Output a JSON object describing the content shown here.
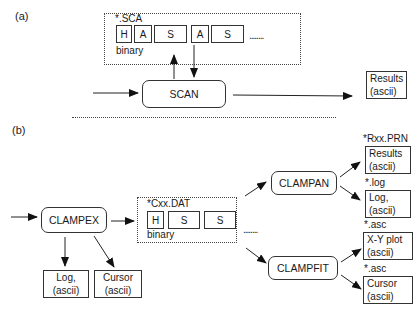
{
  "panel_a": {
    "label": "(a)",
    "file_group": {
      "name": "*.SCA",
      "cells": [
        "H",
        "A",
        "S",
        "A",
        "S"
      ],
      "ellipsis": "........",
      "format": "binary"
    },
    "process": "SCAN",
    "output": {
      "line1": "Results",
      "line2": "(ascii)"
    }
  },
  "panel_b": {
    "label": "(b)",
    "acquire_process": "CLAMPEX",
    "acquire_outputs": [
      {
        "line1": "Log,",
        "line2": "(ascii)"
      },
      {
        "line1": "Cursor",
        "line2": "(ascii)"
      }
    ],
    "file_group": {
      "name": "*Cxx.DAT",
      "cells": [
        "H",
        "S",
        "S"
      ],
      "ellipsis": "........",
      "format": "binary"
    },
    "clampan": {
      "name": "CLAMPAN",
      "outputs": [
        {
          "ext": "*Rxx.PRN",
          "line1": "Results",
          "line2": "(ascii)"
        },
        {
          "ext": "*.log",
          "line1": "Log,",
          "line2": "(ascii)"
        }
      ]
    },
    "clampfit": {
      "name": "CLAMPFIT",
      "outputs": [
        {
          "ext": "*.asc",
          "line1": "X-Y plot",
          "line2": "(ascii)"
        },
        {
          "ext": "*.asc",
          "line1": "Cursor",
          "line2": "(ascii)"
        }
      ]
    }
  }
}
